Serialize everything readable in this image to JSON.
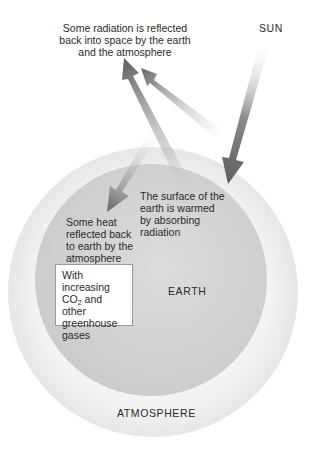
{
  "diagram": {
    "labels": {
      "sun": "SUN",
      "reflected_to_space": [
        "Some radiation is reflected",
        "back into space by the earth",
        "and the atmosphere"
      ],
      "surface_warmed": [
        "The surface of the",
        "earth is warmed",
        "by absorbing",
        "radiation"
      ],
      "heat_reflected_back": [
        "Some heat",
        "reflected back",
        "to earth by the",
        "atmosphere"
      ],
      "earth": "EARTH",
      "atmosphere": "ATMOSPHERE"
    },
    "note_box": {
      "line1": "With increasing",
      "co2_prefix": "CO",
      "co2_sub": "2",
      "co2_suffix": " and other",
      "line3": "greenhouse",
      "line4": "gases"
    },
    "colors": {
      "earth_fill": "#d4d4d4",
      "atmosphere_fill": "#efefef",
      "arrow_dark": "#6e6e6e",
      "background": "#ffffff"
    }
  }
}
